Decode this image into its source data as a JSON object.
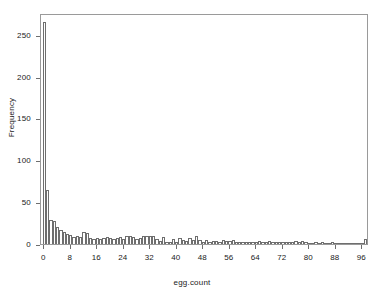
{
  "chart_data": {
    "type": "bar",
    "title": "",
    "subtitle": "",
    "xlabel": "egg.count",
    "ylabel": "Frequency",
    "grid": false,
    "legend": "none",
    "bin_width": 1,
    "xlim": [
      -1,
      98
    ],
    "ylim": [
      0,
      276
    ],
    "xticks": [
      0,
      8,
      16,
      24,
      32,
      40,
      48,
      56,
      64,
      72,
      80,
      88,
      96
    ],
    "xtick_labels": [
      "0",
      "8",
      "16",
      "24",
      "32",
      "40",
      "48",
      "56",
      "64",
      "72",
      "80",
      "88",
      "96"
    ],
    "yticks": [
      0,
      50,
      100,
      150,
      200,
      250
    ],
    "ytick_labels": [
      "0",
      "50",
      "100",
      "150",
      "200",
      "250"
    ],
    "bar_facecolor": "#ffffff",
    "bar_edgecolor": "#6e6e6e",
    "frame_color": "#9a9a9a",
    "background": "#ffffff",
    "categories": [
      0,
      1,
      2,
      3,
      4,
      5,
      6,
      7,
      8,
      9,
      10,
      11,
      12,
      13,
      14,
      15,
      16,
      17,
      18,
      19,
      20,
      21,
      22,
      23,
      24,
      25,
      26,
      27,
      28,
      29,
      30,
      31,
      32,
      33,
      34,
      35,
      36,
      37,
      38,
      39,
      40,
      41,
      42,
      43,
      44,
      45,
      46,
      47,
      48,
      49,
      50,
      51,
      52,
      53,
      54,
      55,
      56,
      57,
      58,
      59,
      60,
      61,
      62,
      63,
      64,
      65,
      66,
      67,
      68,
      69,
      70,
      71,
      72,
      73,
      74,
      75,
      76,
      77,
      78,
      79,
      80,
      81,
      82,
      83,
      84,
      85,
      86,
      87,
      88,
      89,
      90,
      91,
      92,
      93,
      94,
      95,
      96,
      97
    ],
    "values": [
      265,
      65,
      29,
      28,
      20,
      17,
      14,
      12,
      11,
      8,
      10,
      8,
      14,
      13,
      7,
      6,
      7,
      6,
      7,
      8,
      7,
      6,
      7,
      8,
      6,
      9,
      9,
      8,
      6,
      7,
      10,
      10,
      9,
      9,
      6,
      4,
      8,
      3,
      3,
      6,
      2,
      7,
      5,
      4,
      7,
      5,
      9,
      5,
      3,
      5,
      2,
      4,
      4,
      3,
      5,
      4,
      4,
      5,
      2,
      3,
      3,
      2,
      2,
      3,
      2,
      4,
      3,
      3,
      4,
      2,
      2,
      2,
      3,
      3,
      3,
      2,
      4,
      3,
      4,
      2,
      1,
      1,
      2,
      1,
      2,
      1,
      1,
      2,
      1,
      1,
      1,
      1,
      1,
      1,
      1,
      1,
      1,
      6
    ]
  }
}
